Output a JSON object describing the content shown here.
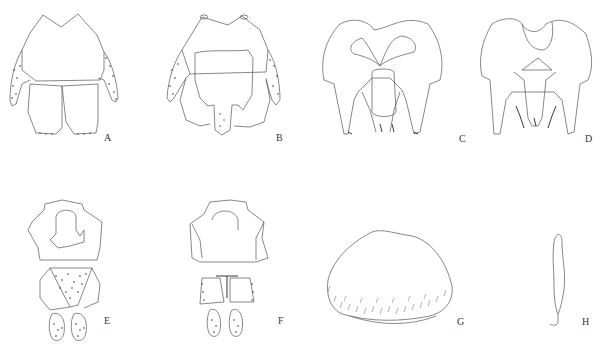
{
  "figure": {
    "type": "morphological line drawings",
    "panels": [
      {
        "id": "A",
        "label": "A",
        "description": "abdominal tergites, dorsal view with setose lateral lobes"
      },
      {
        "id": "B",
        "label": "B",
        "description": "abdominal segment, ventral view with central plate and setose lateral lobes"
      },
      {
        "id": "C",
        "label": "C",
        "description": "male genitalia, dorsal view"
      },
      {
        "id": "D",
        "label": "D",
        "description": "male genitalia, ventral view"
      },
      {
        "id": "E",
        "label": "E",
        "description": "terminal segments with setose triangular plate and cerci"
      },
      {
        "id": "F",
        "label": "F",
        "description": "terminal segments, ventral view with T-shaped structure and cerci"
      },
      {
        "id": "G",
        "label": "G",
        "description": "subgenital plate with marginal setae"
      },
      {
        "id": "H",
        "label": "H",
        "description": "elongate appendage with hooked tip"
      }
    ]
  },
  "colors": {
    "background": "#ffffff",
    "line": "#555555",
    "label": "#333333"
  }
}
